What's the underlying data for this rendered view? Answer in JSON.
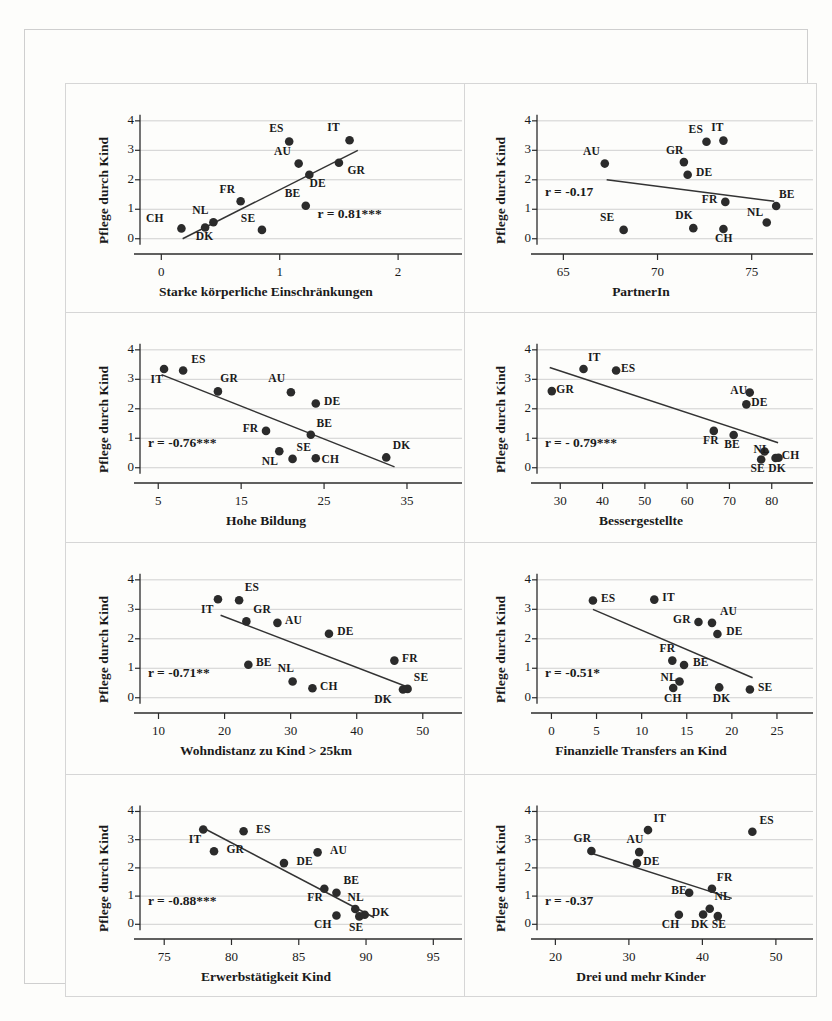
{
  "figure": {
    "type": "scatter-matrix",
    "panel_count": 8,
    "shared_ylabel": "Pflege durch Kind",
    "countries": [
      "IT",
      "ES",
      "GR",
      "AU",
      "DE",
      "BE",
      "FR",
      "NL",
      "CH",
      "SE",
      "DK"
    ]
  },
  "chart_data": [
    {
      "id": "panel1",
      "type": "scatter",
      "title": "",
      "xlabel": "Starke körperliche Einschränkungen",
      "ylabel": "Pflege durch Kind",
      "xlim": [
        -0.18,
        2.32
      ],
      "ylim": [
        -0.45,
        4.3
      ],
      "xticks": [
        0,
        1,
        2
      ],
      "xticklabels": [
        "0",
        "1",
        "2"
      ],
      "yticks": [
        0,
        1,
        2,
        3,
        4
      ],
      "yticklabels": [
        "0",
        "1",
        "2",
        "3",
        "4"
      ],
      "grid": true,
      "annotation": "r = 0.81***",
      "r": 0.81,
      "points": [
        {
          "label": "CH",
          "x": 0.17,
          "y": 0.35,
          "lx": -0.12,
          "ly": 0.62
        },
        {
          "label": "DK",
          "x": 0.37,
          "y": 0.38,
          "lx": 0.3,
          "ly": 0.04
        },
        {
          "label": "NL",
          "x": 0.44,
          "y": 0.56,
          "lx": 0.27,
          "ly": 0.9
        },
        {
          "label": "FR",
          "x": 0.67,
          "y": 1.27,
          "lx": 0.5,
          "ly": 1.63
        },
        {
          "label": "SE",
          "x": 0.85,
          "y": 0.3,
          "lx": 0.68,
          "ly": 0.65
        },
        {
          "label": "ES",
          "x": 1.08,
          "y": 3.3,
          "lx": 0.92,
          "ly": 3.68
        },
        {
          "label": "AU",
          "x": 1.16,
          "y": 2.55,
          "lx": 0.96,
          "ly": 2.9
        },
        {
          "label": "BE",
          "x": 1.22,
          "y": 1.12,
          "lx": 1.05,
          "ly": 1.49
        },
        {
          "label": "DE",
          "x": 1.25,
          "y": 2.17,
          "lx": 1.26,
          "ly": 1.82
        },
        {
          "label": "IT",
          "x": 1.59,
          "y": 3.34,
          "lx": 1.41,
          "ly": 3.72
        },
        {
          "label": "GR",
          "x": 1.5,
          "y": 2.58,
          "lx": 1.58,
          "ly": 2.28
        }
      ],
      "fit": {
        "x1": 0.18,
        "y1": 0.0,
        "x2": 1.66,
        "y2": 3.0
      }
    },
    {
      "id": "panel2",
      "type": "scatter",
      "xlabel": "PartnerIn",
      "ylabel": "Pflege durch Kind",
      "xlim": [
        63.6,
        77.3
      ],
      "ylim": [
        -0.45,
        4.3
      ],
      "xticks": [
        65,
        70,
        75
      ],
      "xticklabels": [
        "65",
        "70",
        "75"
      ],
      "yticks": [
        0,
        1,
        2,
        3,
        4
      ],
      "yticklabels": [
        "0",
        "1",
        "2",
        "3",
        "4"
      ],
      "grid": true,
      "annotation": "r = -0.17",
      "r": -0.17,
      "points": [
        {
          "label": "AU",
          "x": 67.2,
          "y": 2.55,
          "lx": 66.1,
          "ly": 2.92
        },
        {
          "label": "SE",
          "x": 68.2,
          "y": 0.3,
          "lx": 67.0,
          "ly": 0.66
        },
        {
          "label": "GR",
          "x": 71.4,
          "y": 2.6,
          "lx": 70.5,
          "ly": 2.95
        },
        {
          "label": "DE",
          "x": 71.6,
          "y": 2.17,
          "lx": 72.1,
          "ly": 2.19
        },
        {
          "label": "DK",
          "x": 71.9,
          "y": 0.36,
          "lx": 71.0,
          "ly": 0.74
        },
        {
          "label": "ES",
          "x": 72.6,
          "y": 3.29,
          "lx": 71.7,
          "ly": 3.66
        },
        {
          "label": "IT",
          "x": 73.5,
          "y": 3.33,
          "lx": 72.9,
          "ly": 3.72
        },
        {
          "label": "FR",
          "x": 73.6,
          "y": 1.25,
          "lx": 72.4,
          "ly": 1.29
        },
        {
          "label": "CH",
          "x": 73.5,
          "y": 0.33,
          "lx": 73.1,
          "ly": -0.03
        },
        {
          "label": "NL",
          "x": 75.8,
          "y": 0.55,
          "lx": 74.8,
          "ly": 0.85
        },
        {
          "label": "BE",
          "x": 76.3,
          "y": 1.11,
          "lx": 76.5,
          "ly": 1.45
        }
      ],
      "fit": {
        "x1": 67.3,
        "y1": 2.0,
        "x2": 76.2,
        "y2": 1.27
      }
    },
    {
      "id": "panel3",
      "type": "scatter",
      "xlabel": "Hohe Bildung",
      "ylabel": "Pflege durch Kind",
      "xlim": [
        2.8,
        38.5
      ],
      "ylim": [
        -0.45,
        4.3
      ],
      "xticks": [
        5,
        15,
        25,
        35
      ],
      "xticklabels": [
        "5",
        "15",
        "25",
        "35"
      ],
      "yticks": [
        0,
        1,
        2,
        3,
        4
      ],
      "yticklabels": [
        "0",
        "1",
        "2",
        "3",
        "4"
      ],
      "grid": true,
      "annotation": "r = -0.76***",
      "r": -0.76,
      "points": [
        {
          "label": "IT",
          "x": 5.7,
          "y": 3.35,
          "lx": 4.2,
          "ly": 2.95
        },
        {
          "label": "ES",
          "x": 8.0,
          "y": 3.3,
          "lx": 9.1,
          "ly": 3.62
        },
        {
          "label": "GR",
          "x": 12.2,
          "y": 2.59,
          "lx": 12.6,
          "ly": 2.97
        },
        {
          "label": "AU",
          "x": 21.0,
          "y": 2.56,
          "lx": 18.4,
          "ly": 2.96
        },
        {
          "label": "DE",
          "x": 24.0,
          "y": 2.18,
          "lx": 25.1,
          "ly": 2.2
        },
        {
          "label": "FR",
          "x": 18.0,
          "y": 1.25,
          "lx": 15.3,
          "ly": 1.28
        },
        {
          "label": "BE",
          "x": 23.4,
          "y": 1.12,
          "lx": 24.2,
          "ly": 1.45
        },
        {
          "label": "NL",
          "x": 19.6,
          "y": 0.56,
          "lx": 17.6,
          "ly": 0.17
        },
        {
          "label": "SE",
          "x": 21.2,
          "y": 0.3,
          "lx": 21.8,
          "ly": 0.65
        },
        {
          "label": "CH",
          "x": 24.0,
          "y": 0.32,
          "lx": 24.8,
          "ly": 0.22
        },
        {
          "label": "DK",
          "x": 32.5,
          "y": 0.35,
          "lx": 33.4,
          "ly": 0.7
        }
      ],
      "fit": {
        "x1": 5.4,
        "y1": 3.16,
        "x2": 33.5,
        "y2": 0.03
      }
    },
    {
      "id": "panel4",
      "type": "scatter",
      "xlabel": "Bessergestellte",
      "ylabel": "Pflege durch Kind",
      "xlim": [
        24.5,
        85.5
      ],
      "ylim": [
        -0.45,
        4.3
      ],
      "xticks": [
        30,
        40,
        50,
        60,
        70,
        80
      ],
      "xticklabels": [
        "30",
        "40",
        "50",
        "60",
        "70",
        "80"
      ],
      "yticks": [
        0,
        1,
        2,
        3,
        4
      ],
      "yticklabels": [
        "0",
        "1",
        "2",
        "3",
        "4"
      ],
      "grid": true,
      "annotation": "r = - 0.79***",
      "r": -0.79,
      "points": [
        {
          "label": "GR",
          "x": 28.0,
          "y": 2.6,
          "lx": 29.3,
          "ly": 2.62
        },
        {
          "label": "IT",
          "x": 35.5,
          "y": 3.35,
          "lx": 36.8,
          "ly": 3.68
        },
        {
          "label": "ES",
          "x": 43.2,
          "y": 3.3,
          "lx": 44.6,
          "ly": 3.32
        },
        {
          "label": "AU",
          "x": 74.8,
          "y": 2.55,
          "lx": 70.4,
          "ly": 2.58
        },
        {
          "label": "DE",
          "x": 74.0,
          "y": 2.15,
          "lx": 75.4,
          "ly": 2.17
        },
        {
          "label": "FR",
          "x": 66.3,
          "y": 1.25,
          "lx": 64.0,
          "ly": 0.88
        },
        {
          "label": "BE",
          "x": 71.0,
          "y": 1.11,
          "lx": 69.0,
          "ly": 0.73
        },
        {
          "label": "NL",
          "x": 78.3,
          "y": 0.55,
          "lx": 75.9,
          "ly": 0.58
        },
        {
          "label": "SE",
          "x": 77.5,
          "y": 0.28,
          "lx": 75.2,
          "ly": -0.08
        },
        {
          "label": "DK",
          "x": 80.9,
          "y": 0.33,
          "lx": 79.4,
          "ly": -0.08
        },
        {
          "label": "CH",
          "x": 81.6,
          "y": 0.34,
          "lx": 82.6,
          "ly": 0.37
        }
      ],
      "fit": {
        "x1": 27.5,
        "y1": 3.4,
        "x2": 81.5,
        "y2": 0.85
      }
    },
    {
      "id": "panel5",
      "type": "scatter",
      "xlabel": "Wohndistanz zu Kind > 25km",
      "ylabel": "Pflege durch Kind",
      "xlim": [
        7.2,
        52.0
      ],
      "ylim": [
        -0.45,
        4.3
      ],
      "xticks": [
        10,
        20,
        30,
        40,
        50
      ],
      "xticklabels": [
        "10",
        "20",
        "30",
        "40",
        "50"
      ],
      "yticks": [
        0,
        1,
        2,
        3,
        4
      ],
      "yticklabels": [
        "0",
        "1",
        "2",
        "3",
        "4"
      ],
      "grid": true,
      "annotation": "r = -0.71**",
      "r": -0.71,
      "points": [
        {
          "label": "IT",
          "x": 19.0,
          "y": 3.34,
          "lx": 16.6,
          "ly": 2.94
        },
        {
          "label": "ES",
          "x": 22.2,
          "y": 3.31,
          "lx": 23.2,
          "ly": 3.68
        },
        {
          "label": "GR",
          "x": 23.3,
          "y": 2.59,
          "lx": 24.5,
          "ly": 2.94
        },
        {
          "label": "AU",
          "x": 28.0,
          "y": 2.54,
          "lx": 29.3,
          "ly": 2.56
        },
        {
          "label": "DE",
          "x": 35.8,
          "y": 2.17,
          "lx": 37.2,
          "ly": 2.2
        },
        {
          "label": "BE",
          "x": 23.6,
          "y": 1.12,
          "lx": 24.9,
          "ly": 1.14
        },
        {
          "label": "NL",
          "x": 30.3,
          "y": 0.55,
          "lx": 28.2,
          "ly": 0.93
        },
        {
          "label": "CH",
          "x": 33.3,
          "y": 0.32,
          "lx": 34.6,
          "ly": 0.34
        },
        {
          "label": "FR",
          "x": 45.7,
          "y": 1.26,
          "lx": 47.0,
          "ly": 1.29
        },
        {
          "label": "SE",
          "x": 47.7,
          "y": 0.3,
          "lx": 48.8,
          "ly": 0.63
        },
        {
          "label": "DK",
          "x": 47.0,
          "y": 0.28,
          "lx": 42.8,
          "ly": -0.12
        }
      ],
      "fit": {
        "x1": 19.4,
        "y1": 2.8,
        "x2": 48.0,
        "y2": 0.34
      }
    },
    {
      "id": "panel6",
      "type": "scatter",
      "xlabel": "Finanzielle Transfers an Kind",
      "ylabel": "Pflege durch Kind",
      "xlim": [
        -1.6,
        27.0
      ],
      "ylim": [
        -0.45,
        4.3
      ],
      "xticks": [
        0,
        5,
        10,
        15,
        20,
        25
      ],
      "xticklabels": [
        "0",
        "5",
        "10",
        "15",
        "20",
        "25"
      ],
      "yticks": [
        0,
        1,
        2,
        3,
        4
      ],
      "yticklabels": [
        "0",
        "1",
        "2",
        "3",
        "4"
      ],
      "grid": true,
      "annotation": "r = -0.51*",
      "r": -0.51,
      "points": [
        {
          "label": "ES",
          "x": 4.6,
          "y": 3.3,
          "lx": 5.6,
          "ly": 3.32
        },
        {
          "label": "IT",
          "x": 11.4,
          "y": 3.33,
          "lx": 12.4,
          "ly": 3.35
        },
        {
          "label": "GR",
          "x": 16.3,
          "y": 2.57,
          "lx": 13.6,
          "ly": 2.6
        },
        {
          "label": "AU",
          "x": 17.8,
          "y": 2.54,
          "lx": 18.8,
          "ly": 2.87
        },
        {
          "label": "DE",
          "x": 18.4,
          "y": 2.16,
          "lx": 19.5,
          "ly": 2.18
        },
        {
          "label": "FR",
          "x": 13.4,
          "y": 1.26,
          "lx": 12.1,
          "ly": 1.62
        },
        {
          "label": "BE",
          "x": 14.7,
          "y": 1.11,
          "lx": 15.8,
          "ly": 1.13
        },
        {
          "label": "NL",
          "x": 14.2,
          "y": 0.55,
          "lx": 12.2,
          "ly": 0.62
        },
        {
          "label": "CH",
          "x": 13.5,
          "y": 0.33,
          "lx": 12.6,
          "ly": -0.06
        },
        {
          "label": "DK",
          "x": 18.6,
          "y": 0.35,
          "lx": 18.0,
          "ly": -0.06
        },
        {
          "label": "SE",
          "x": 22.0,
          "y": 0.28,
          "lx": 23.0,
          "ly": 0.3
        }
      ],
      "fit": {
        "x1": 4.6,
        "y1": 3.0,
        "x2": 22.3,
        "y2": 0.68
      }
    },
    {
      "id": "panel7",
      "type": "scatter",
      "xlabel": "Erwerbstätigkeit Kind",
      "ylabel": "Pflege durch Kind",
      "xlim": [
        73.2,
        95.2
      ],
      "ylim": [
        -0.45,
        4.3
      ],
      "xticks": [
        75,
        80,
        85,
        90,
        95
      ],
      "xticklabels": [
        "75",
        "80",
        "85",
        "90",
        "95"
      ],
      "yticks": [
        0,
        1,
        2,
        3,
        4
      ],
      "yticklabels": [
        "0",
        "1",
        "2",
        "3",
        "4"
      ],
      "grid": true,
      "annotation": "r = -0.88***",
      "r": -0.88,
      "points": [
        {
          "label": "IT",
          "x": 77.9,
          "y": 3.36,
          "lx": 76.9,
          "ly": 2.95
        },
        {
          "label": "ES",
          "x": 80.9,
          "y": 3.3,
          "lx": 81.9,
          "ly": 3.32
        },
        {
          "label": "GR",
          "x": 78.7,
          "y": 2.59,
          "lx": 79.7,
          "ly": 2.61
        },
        {
          "label": "AU",
          "x": 86.4,
          "y": 2.55,
          "lx": 87.4,
          "ly": 2.57
        },
        {
          "label": "DE",
          "x": 83.9,
          "y": 2.17,
          "lx": 84.9,
          "ly": 2.19
        },
        {
          "label": "FR",
          "x": 86.9,
          "y": 1.26,
          "lx": 85.7,
          "ly": 0.88
        },
        {
          "label": "BE",
          "x": 87.8,
          "y": 1.12,
          "lx": 88.4,
          "ly": 1.49
        },
        {
          "label": "NL",
          "x": 89.2,
          "y": 0.54,
          "lx": 88.7,
          "ly": 0.9
        },
        {
          "label": "CH",
          "x": 87.8,
          "y": 0.31,
          "lx": 86.2,
          "ly": -0.07
        },
        {
          "label": "SE",
          "x": 89.5,
          "y": 0.28,
          "lx": 88.8,
          "ly": -0.18
        },
        {
          "label": "DK",
          "x": 89.9,
          "y": 0.34,
          "lx": 90.5,
          "ly": 0.36
        }
      ],
      "fit": {
        "x1": 77.8,
        "y1": 3.44,
        "x2": 90.6,
        "y2": 0.24
      }
    },
    {
      "id": "panel8",
      "type": "scatter",
      "xlabel": "Drei und mehr Kinder",
      "ylabel": "Pflege durch Kind",
      "xlim": [
        17.5,
        52.6
      ],
      "ylim": [
        -0.45,
        4.3
      ],
      "xticks": [
        20,
        30,
        40,
        50
      ],
      "xticklabels": [
        "20",
        "30",
        "40",
        "50"
      ],
      "yticks": [
        0,
        1,
        2,
        3,
        4
      ],
      "yticklabels": [
        "0",
        "1",
        "2",
        "3",
        "4"
      ],
      "grid": true,
      "annotation": "r = -0.37",
      "r": -0.37,
      "points": [
        {
          "label": "GR",
          "x": 24.9,
          "y": 2.6,
          "lx": 22.6,
          "ly": 2.98
        },
        {
          "label": "AU",
          "x": 31.4,
          "y": 2.56,
          "lx": 29.8,
          "ly": 2.95
        },
        {
          "label": "DE",
          "x": 31.1,
          "y": 2.17,
          "lx": 32.1,
          "ly": 2.19
        },
        {
          "label": "IT",
          "x": 32.6,
          "y": 3.34,
          "lx": 33.5,
          "ly": 3.7
        },
        {
          "label": "ES",
          "x": 46.8,
          "y": 3.28,
          "lx": 47.9,
          "ly": 3.62
        },
        {
          "label": "FR",
          "x": 41.3,
          "y": 1.26,
          "lx": 42.1,
          "ly": 1.62
        },
        {
          "label": "BE",
          "x": 38.2,
          "y": 1.12,
          "lx": 35.9,
          "ly": 1.14
        },
        {
          "label": "NL",
          "x": 41.0,
          "y": 0.55,
          "lx": 41.8,
          "ly": 0.92
        },
        {
          "label": "CH",
          "x": 36.8,
          "y": 0.34,
          "lx": 34.6,
          "ly": -0.05
        },
        {
          "label": "DK",
          "x": 40.1,
          "y": 0.35,
          "lx": 38.6,
          "ly": -0.06
        },
        {
          "label": "SE",
          "x": 42.1,
          "y": 0.29,
          "lx": 41.4,
          "ly": -0.06
        }
      ],
      "fit": {
        "x1": 24.9,
        "y1": 2.52,
        "x2": 44.0,
        "y2": 0.92
      }
    }
  ]
}
